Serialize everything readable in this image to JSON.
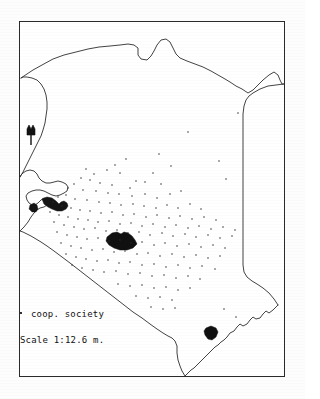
{
  "figure": {
    "frame": {
      "x": 19,
      "y": 21,
      "width": 266,
      "height": 356
    },
    "background_color": "#ffffff",
    "ink_color": "#111111"
  },
  "legend": {
    "society_symbol": "dot-symbol",
    "society_label": "coop. society",
    "scale_label": "Scale 1:12.6 m."
  },
  "compass": {
    "name": "north-arrow",
    "x": 29,
    "y": 131
  },
  "features": [
    {
      "name": "nairobi-marker",
      "label": "Nairobi",
      "x": 112,
      "y": 243,
      "type": "filled-blob"
    },
    {
      "name": "mombasa-marker",
      "label": "Mombasa",
      "x": 210,
      "y": 334,
      "type": "filled-blob"
    },
    {
      "name": "lake-victoria-gulf",
      "label": "Winam Gulf",
      "x": 43,
      "y": 201,
      "type": "filled-water"
    }
  ],
  "chart_data": {
    "type": "scatter",
    "title": "coop. society",
    "xlabel": "",
    "ylabel": "",
    "legend_position": "bottom-left",
    "grid": false,
    "note": "Dot distribution map: each dot marks one cooperative society location within Kenya.",
    "xlim": [
      0,
      266
    ],
    "ylim": [
      0,
      356
    ],
    "series": [
      {
        "name": "coop. society",
        "marker": "dot",
        "color": "#2b2b2b",
        "points": [
          [
            218,
            91
          ],
          [
            168,
            110
          ],
          [
            199,
            139
          ],
          [
            206,
            157
          ],
          [
            139,
            132
          ],
          [
            106,
            137
          ],
          [
            133,
            151
          ],
          [
            151,
            144
          ],
          [
            116,
            159
          ],
          [
            95,
            143
          ],
          [
            87,
            148
          ],
          [
            74,
            152
          ],
          [
            66,
            147
          ],
          [
            100,
            151
          ],
          [
            125,
            160
          ],
          [
            141,
            162
          ],
          [
            110,
            166
          ],
          [
            92,
            163
          ],
          [
            80,
            161
          ],
          [
            70,
            158
          ],
          [
            61,
            156
          ],
          [
            54,
            162
          ],
          [
            48,
            166
          ],
          [
            63,
            168
          ],
          [
            76,
            169
          ],
          [
            88,
            171
          ],
          [
            99,
            172
          ],
          [
            112,
            174
          ],
          [
            125,
            172
          ],
          [
            137,
            176
          ],
          [
            150,
            172
          ],
          [
            161,
            169
          ],
          [
            46,
            173
          ],
          [
            38,
            175
          ],
          [
            55,
            177
          ],
          [
            67,
            178
          ],
          [
            79,
            180
          ],
          [
            90,
            181
          ],
          [
            101,
            183
          ],
          [
            113,
            182
          ],
          [
            124,
            184
          ],
          [
            136,
            186
          ],
          [
            147,
            183
          ],
          [
            158,
            186
          ],
          [
            170,
            182
          ],
          [
            181,
            187
          ],
          [
            33,
            180
          ],
          [
            42,
            184
          ],
          [
            51,
            186
          ],
          [
            60,
            188
          ],
          [
            70,
            189
          ],
          [
            81,
            191
          ],
          [
            92,
            190
          ],
          [
            103,
            193
          ],
          [
            114,
            192
          ],
          [
            126,
            195
          ],
          [
            137,
            193
          ],
          [
            149,
            196
          ],
          [
            160,
            194
          ],
          [
            172,
            197
          ],
          [
            184,
            195
          ],
          [
            196,
            198
          ],
          [
            30,
            190
          ],
          [
            39,
            193
          ],
          [
            48,
            195
          ],
          [
            58,
            197
          ],
          [
            68,
            198
          ],
          [
            78,
            200
          ],
          [
            89,
            199
          ],
          [
            100,
            202
          ],
          [
            111,
            201
          ],
          [
            122,
            204
          ],
          [
            133,
            202
          ],
          [
            145,
            205
          ],
          [
            156,
            203
          ],
          [
            168,
            206
          ],
          [
            179,
            204
          ],
          [
            191,
            207
          ],
          [
            203,
            205
          ],
          [
            215,
            208
          ],
          [
            34,
            200
          ],
          [
            44,
            203
          ],
          [
            54,
            205
          ],
          [
            64,
            207
          ],
          [
            75,
            206
          ],
          [
            86,
            209
          ],
          [
            97,
            208
          ],
          [
            108,
            211
          ],
          [
            119,
            210
          ],
          [
            130,
            213
          ],
          [
            142,
            211
          ],
          [
            153,
            214
          ],
          [
            165,
            212
          ],
          [
            176,
            215
          ],
          [
            188,
            213
          ],
          [
            200,
            216
          ],
          [
            212,
            214
          ],
          [
            37,
            210
          ],
          [
            47,
            213
          ],
          [
            57,
            215
          ],
          [
            67,
            217
          ],
          [
            78,
            216
          ],
          [
            89,
            219
          ],
          [
            100,
            218
          ],
          [
            111,
            221
          ],
          [
            122,
            220
          ],
          [
            134,
            223
          ],
          [
            145,
            221
          ],
          [
            157,
            224
          ],
          [
            169,
            222
          ],
          [
            181,
            225
          ],
          [
            193,
            223
          ],
          [
            205,
            226
          ],
          [
            41,
            221
          ],
          [
            51,
            224
          ],
          [
            61,
            226
          ],
          [
            72,
            228
          ],
          [
            83,
            227
          ],
          [
            94,
            230
          ],
          [
            105,
            229
          ],
          [
            117,
            232
          ],
          [
            128,
            231
          ],
          [
            140,
            234
          ],
          [
            152,
            232
          ],
          [
            164,
            235
          ],
          [
            176,
            233
          ],
          [
            188,
            236
          ],
          [
            200,
            234
          ],
          [
            46,
            232
          ],
          [
            56,
            235
          ],
          [
            66,
            237
          ],
          [
            77,
            239
          ],
          [
            88,
            238
          ],
          [
            99,
            241
          ],
          [
            110,
            240
          ],
          [
            122,
            243
          ],
          [
            134,
            242
          ],
          [
            146,
            245
          ],
          [
            158,
            243
          ],
          [
            170,
            246
          ],
          [
            182,
            244
          ],
          [
            195,
            247
          ],
          [
            52,
            243
          ],
          [
            62,
            246
          ],
          [
            73,
            248
          ],
          [
            84,
            250
          ],
          [
            96,
            249
          ],
          [
            108,
            252
          ],
          [
            120,
            251
          ],
          [
            132,
            254
          ],
          [
            144,
            253
          ],
          [
            156,
            256
          ],
          [
            168,
            254
          ],
          [
            180,
            257
          ],
          [
            98,
            262
          ],
          [
            110,
            264
          ],
          [
            122,
            263
          ],
          [
            134,
            266
          ],
          [
            146,
            265
          ],
          [
            158,
            268
          ],
          [
            170,
            266
          ],
          [
            116,
            274
          ],
          [
            128,
            276
          ],
          [
            140,
            275
          ],
          [
            152,
            278
          ],
          [
            131,
            285
          ],
          [
            143,
            287
          ],
          [
            155,
            286
          ],
          [
            204,
            287
          ],
          [
            216,
            295
          ]
        ]
      }
    ]
  }
}
